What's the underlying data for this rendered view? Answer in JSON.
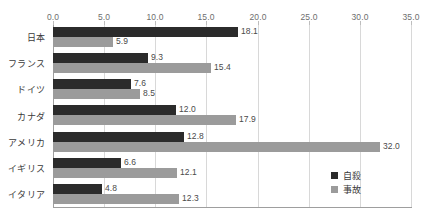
{
  "chart_data": {
    "type": "bar",
    "orientation": "horizontal",
    "title": "",
    "subtitle": "",
    "xlabel": "",
    "ylabel": "",
    "xlim": [
      0.0,
      35.0
    ],
    "xticks": [
      "0.0",
      "5.0",
      "10.0",
      "15.0",
      "20.0",
      "25.0",
      "30.0",
      "35.0"
    ],
    "xtick_values": [
      0.0,
      5.0,
      10.0,
      15.0,
      20.0,
      25.0,
      30.0,
      35.0
    ],
    "grid": "vertical",
    "legend_position": "inside-bottom-right",
    "categories": [
      "日本",
      "フランス",
      "ドイツ",
      "カナダ",
      "アメリカ",
      "イギリス",
      "イタリア"
    ],
    "series": [
      {
        "name": "自殺",
        "color": "#2b2b2b",
        "values": [
          18.1,
          9.3,
          7.6,
          12.0,
          12.8,
          6.6,
          4.8
        ],
        "labels": [
          "18.1",
          "9.3",
          "7.6",
          "12.0",
          "12.8",
          "6.6",
          "4.8"
        ]
      },
      {
        "name": "事故",
        "color": "#9b9b9b",
        "values": [
          5.9,
          15.4,
          8.5,
          17.9,
          32.0,
          12.1,
          12.3
        ],
        "labels": [
          "5.9",
          "15.4",
          "8.5",
          "17.9",
          "32.0",
          "12.1",
          "12.3"
        ]
      }
    ]
  },
  "colors": {
    "series_suicide": "#2b2b2b",
    "series_accident": "#9b9b9b",
    "gridline": "#d8d8d8",
    "axis": "#9e9e9e",
    "text": "#3a3a3a",
    "tick_text": "#6e6e6e",
    "background": "#ffffff"
  }
}
